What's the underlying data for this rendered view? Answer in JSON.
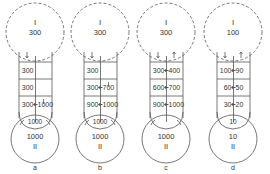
{
  "colors": {
    "line": "#555555",
    "text": "#333333",
    "background": "#ffffff"
  },
  "panels": [
    {
      "label": "a",
      "top": {
        "roman": "I",
        "value": "300"
      },
      "bottom": {
        "roman": "II",
        "value": "1000"
      },
      "overlap_value": "1000",
      "rows": [
        {
          "left": "300",
          "right": "",
          "arrow": false
        },
        {
          "left": "300",
          "right": "",
          "arrow": false
        },
        {
          "left": "300",
          "right": "1000",
          "arrow": true
        }
      ]
    },
    {
      "label": "b",
      "top": {
        "roman": "I",
        "value": "300"
      },
      "bottom": {
        "roman": "II",
        "value": "1000"
      },
      "overlap_value": "1000",
      "rows": [
        {
          "left": "300",
          "right": "",
          "arrow": false
        },
        {
          "left": "300",
          "right": "700",
          "arrow": true
        },
        {
          "left": "900",
          "right": "1000",
          "arrow": true
        }
      ]
    },
    {
      "label": "c",
      "top": {
        "roman": "I",
        "value": "300"
      },
      "bottom": {
        "roman": "II",
        "value": "1000"
      },
      "overlap_value": "",
      "rows": [
        {
          "left": "300",
          "right": "400",
          "arrow": true
        },
        {
          "left": "600",
          "right": "700",
          "arrow": true
        },
        {
          "left": "900",
          "right": "1000",
          "arrow": true
        }
      ]
    },
    {
      "label": "d",
      "top": {
        "roman": "I",
        "value": "100"
      },
      "bottom": {
        "roman": "II",
        "value": "10"
      },
      "overlap_value": "10",
      "rows": [
        {
          "left": "100",
          "right": "90",
          "arrow": true
        },
        {
          "left": "60",
          "right": "50",
          "arrow": true
        },
        {
          "left": "30",
          "right": "20",
          "arrow": true
        }
      ]
    }
  ]
}
